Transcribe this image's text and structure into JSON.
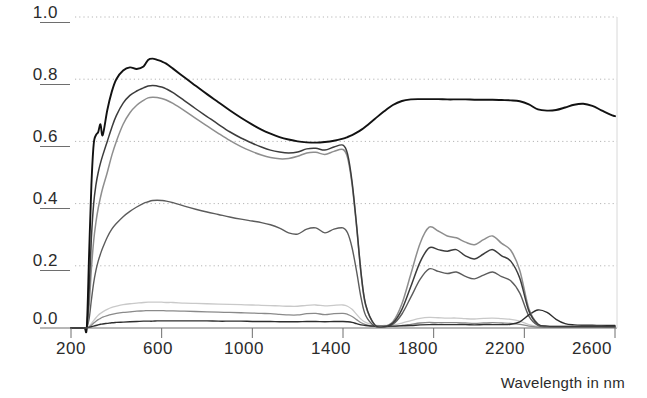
{
  "chart_data": {
    "type": "line",
    "title": "",
    "subtitle": "",
    "xlabel": "Wavelength in nm",
    "ylabel": "",
    "xlim": [
      200,
      2600
    ],
    "ylim": [
      0.0,
      1.0
    ],
    "grid": true,
    "grid_style": "dotted-horizontal",
    "legend": "none",
    "legend_position": "none",
    "x_ticks": [
      200,
      600,
      1000,
      1400,
      1800,
      2200,
      2600
    ],
    "x_tick_labels": [
      "200",
      "600",
      "1000",
      "1400",
      "1800",
      "2200",
      "2600"
    ],
    "y_ticks": [
      0.0,
      0.2,
      0.4,
      0.6,
      0.8,
      1.0
    ],
    "y_tick_labels": [
      "0.0",
      "0.2",
      "0.4",
      "0.6",
      "0.8",
      "1.0"
    ],
    "x": [
      200,
      240,
      260,
      270,
      280,
      290,
      300,
      310,
      320,
      330,
      340,
      360,
      380,
      400,
      430,
      460,
      490,
      520,
      540,
      560,
      580,
      600,
      620,
      650,
      700,
      750,
      800,
      850,
      900,
      950,
      1000,
      1040,
      1080,
      1120,
      1160,
      1200,
      1240,
      1280,
      1320,
      1360,
      1400,
      1420,
      1440,
      1460,
      1480,
      1500,
      1540,
      1580,
      1620,
      1660,
      1700,
      1740,
      1780,
      1820,
      1860,
      1900,
      1940,
      1980,
      2020,
      2060,
      2100,
      2140,
      2180,
      2220,
      2260,
      2300,
      2340,
      2380,
      2420,
      2460,
      2500,
      2540,
      2580,
      2600
    ],
    "series": [
      {
        "name": "curve-1-black",
        "color": "#121212",
        "width": 1.9,
        "values": [
          0.0,
          0.0,
          0.0,
          0.005,
          0.24,
          0.46,
          0.59,
          0.62,
          0.63,
          0.655,
          0.62,
          0.7,
          0.76,
          0.8,
          0.828,
          0.838,
          0.833,
          0.841,
          0.862,
          0.866,
          0.862,
          0.857,
          0.85,
          0.834,
          0.806,
          0.779,
          0.752,
          0.726,
          0.7,
          0.676,
          0.654,
          0.638,
          0.625,
          0.614,
          0.606,
          0.6,
          0.597,
          0.596,
          0.598,
          0.602,
          0.609,
          0.614,
          0.62,
          0.628,
          0.637,
          0.648,
          0.672,
          0.696,
          0.717,
          0.73,
          0.735,
          0.736,
          0.736,
          0.736,
          0.735,
          0.735,
          0.735,
          0.734,
          0.734,
          0.734,
          0.733,
          0.732,
          0.729,
          0.719,
          0.703,
          0.699,
          0.701,
          0.709,
          0.718,
          0.721,
          0.714,
          0.7,
          0.686,
          0.681
        ]
      },
      {
        "name": "curve-2-darkgray",
        "color": "#3c3c3c",
        "width": 1.5,
        "values": [
          0.0,
          0.0,
          0.0,
          0.004,
          0.12,
          0.29,
          0.4,
          0.46,
          0.5,
          0.53,
          0.555,
          0.6,
          0.645,
          0.683,
          0.723,
          0.748,
          0.762,
          0.772,
          0.778,
          0.78,
          0.778,
          0.775,
          0.769,
          0.757,
          0.731,
          0.705,
          0.68,
          0.655,
          0.631,
          0.611,
          0.594,
          0.582,
          0.572,
          0.566,
          0.563,
          0.566,
          0.576,
          0.578,
          0.572,
          0.582,
          0.588,
          0.56,
          0.47,
          0.33,
          0.175,
          0.075,
          0.01,
          0.004,
          0.016,
          0.06,
          0.135,
          0.212,
          0.258,
          0.252,
          0.247,
          0.252,
          0.232,
          0.222,
          0.238,
          0.252,
          0.232,
          0.215,
          0.16,
          0.055,
          0.012,
          0.006,
          0.005,
          0.005,
          0.005,
          0.005,
          0.005,
          0.005,
          0.004,
          0.004
        ]
      },
      {
        "name": "curve-3-midgray",
        "color": "#8e8e8e",
        "width": 1.5,
        "values": [
          0.0,
          0.0,
          0.0,
          0.003,
          0.07,
          0.19,
          0.28,
          0.34,
          0.385,
          0.42,
          0.45,
          0.5,
          0.555,
          0.6,
          0.655,
          0.692,
          0.716,
          0.732,
          0.74,
          0.742,
          0.741,
          0.738,
          0.733,
          0.722,
          0.699,
          0.674,
          0.65,
          0.626,
          0.603,
          0.583,
          0.567,
          0.556,
          0.548,
          0.544,
          0.545,
          0.552,
          0.563,
          0.565,
          0.558,
          0.568,
          0.574,
          0.548,
          0.462,
          0.325,
          0.172,
          0.073,
          0.01,
          0.005,
          0.02,
          0.078,
          0.175,
          0.272,
          0.324,
          0.312,
          0.296,
          0.29,
          0.276,
          0.268,
          0.284,
          0.296,
          0.272,
          0.25,
          0.185,
          0.062,
          0.013,
          0.006,
          0.005,
          0.005,
          0.005,
          0.005,
          0.005,
          0.005,
          0.004,
          0.004
        ]
      },
      {
        "name": "curve-4-gray-mid",
        "color": "#5c5c5c",
        "width": 1.4,
        "values": [
          0.0,
          0.0,
          0.0,
          0.003,
          0.03,
          0.09,
          0.145,
          0.185,
          0.215,
          0.238,
          0.258,
          0.292,
          0.318,
          0.336,
          0.358,
          0.375,
          0.389,
          0.401,
          0.406,
          0.41,
          0.411,
          0.41,
          0.408,
          0.403,
          0.392,
          0.382,
          0.373,
          0.365,
          0.357,
          0.35,
          0.344,
          0.339,
          0.332,
          0.321,
          0.306,
          0.302,
          0.318,
          0.322,
          0.306,
          0.318,
          0.322,
          0.306,
          0.258,
          0.182,
          0.096,
          0.04,
          0.006,
          0.003,
          0.012,
          0.045,
          0.1,
          0.156,
          0.19,
          0.182,
          0.175,
          0.18,
          0.166,
          0.158,
          0.17,
          0.18,
          0.165,
          0.152,
          0.112,
          0.038,
          0.008,
          0.004,
          0.003,
          0.003,
          0.003,
          0.003,
          0.003,
          0.003,
          0.003,
          0.003
        ]
      },
      {
        "name": "curve-5-light",
        "color": "#c9c9c9",
        "width": 1.3,
        "values": [
          0.0,
          0.0,
          0.0,
          0.002,
          0.006,
          0.014,
          0.024,
          0.033,
          0.041,
          0.047,
          0.052,
          0.06,
          0.066,
          0.07,
          0.075,
          0.078,
          0.08,
          0.082,
          0.083,
          0.083,
          0.083,
          0.083,
          0.082,
          0.082,
          0.08,
          0.079,
          0.078,
          0.077,
          0.076,
          0.075,
          0.074,
          0.073,
          0.072,
          0.071,
          0.07,
          0.07,
          0.073,
          0.074,
          0.071,
          0.073,
          0.074,
          0.07,
          0.06,
          0.044,
          0.028,
          0.018,
          0.009,
          0.008,
          0.01,
          0.016,
          0.024,
          0.031,
          0.034,
          0.033,
          0.032,
          0.032,
          0.03,
          0.029,
          0.031,
          0.032,
          0.03,
          0.028,
          0.022,
          0.011,
          0.005,
          0.004,
          0.004,
          0.004,
          0.004,
          0.004,
          0.004,
          0.004,
          0.003,
          0.003
        ]
      },
      {
        "name": "curve-6-gray-low",
        "color": "#8a8a8a",
        "width": 1.3,
        "values": [
          0.0,
          0.0,
          0.0,
          0.002,
          0.004,
          0.009,
          0.016,
          0.022,
          0.027,
          0.031,
          0.035,
          0.04,
          0.044,
          0.047,
          0.05,
          0.052,
          0.054,
          0.055,
          0.056,
          0.056,
          0.056,
          0.056,
          0.055,
          0.055,
          0.054,
          0.053,
          0.052,
          0.051,
          0.05,
          0.049,
          0.048,
          0.047,
          0.046,
          0.044,
          0.042,
          0.042,
          0.046,
          0.047,
          0.043,
          0.046,
          0.047,
          0.044,
          0.037,
          0.027,
          0.017,
          0.011,
          0.005,
          0.004,
          0.005,
          0.008,
          0.012,
          0.016,
          0.018,
          0.017,
          0.017,
          0.017,
          0.016,
          0.015,
          0.016,
          0.017,
          0.016,
          0.015,
          0.012,
          0.006,
          0.003,
          0.003,
          0.003,
          0.003,
          0.003,
          0.003,
          0.003,
          0.003,
          0.002,
          0.002
        ]
      },
      {
        "name": "curve-7-dark-low",
        "color": "#2e2e2e",
        "width": 1.4,
        "values": [
          0.0,
          0.0,
          0.0,
          0.001,
          0.002,
          0.004,
          0.006,
          0.008,
          0.01,
          0.012,
          0.013,
          0.015,
          0.017,
          0.018,
          0.019,
          0.02,
          0.021,
          0.022,
          0.022,
          0.022,
          0.023,
          0.023,
          0.023,
          0.023,
          0.023,
          0.023,
          0.023,
          0.022,
          0.022,
          0.022,
          0.021,
          0.021,
          0.021,
          0.02,
          0.02,
          0.02,
          0.021,
          0.021,
          0.02,
          0.021,
          0.021,
          0.02,
          0.018,
          0.014,
          0.01,
          0.008,
          0.006,
          0.006,
          0.006,
          0.007,
          0.008,
          0.01,
          0.011,
          0.011,
          0.011,
          0.011,
          0.011,
          0.01,
          0.011,
          0.011,
          0.011,
          0.012,
          0.02,
          0.042,
          0.058,
          0.05,
          0.028,
          0.014,
          0.01,
          0.009,
          0.009,
          0.008,
          0.008,
          0.008
        ]
      }
    ]
  },
  "axes": {
    "x_label": "Wavelength in nm",
    "y_labels": [
      "1.0",
      "0.8",
      "0.6",
      "0.4",
      "0.2",
      "0.0"
    ],
    "x_labels": [
      "200",
      "600",
      "1000",
      "1400",
      "1800",
      "2200",
      "2600"
    ]
  },
  "colors": {
    "axis": "#6e6e6e",
    "grid": "#b5b5b5",
    "text": "#2b2b2b"
  }
}
